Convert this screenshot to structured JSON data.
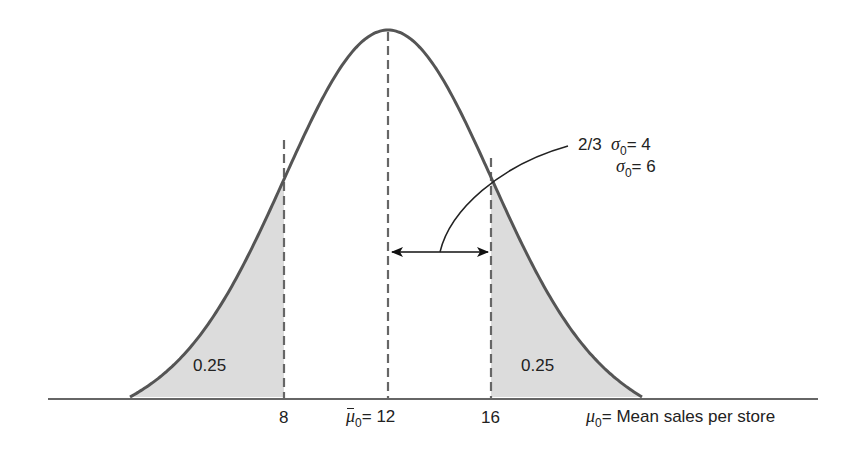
{
  "diagram": {
    "type": "normal-distribution",
    "colors": {
      "curve": "#555555",
      "shade": "#dcdcdc",
      "dashed": "#666666",
      "axis": "#333333",
      "text": "#222222"
    },
    "tails": {
      "left_area": "0.25",
      "right_area": "0.25"
    },
    "ticks": {
      "left": "8",
      "center_symbol": "μ",
      "center_sub": "0",
      "center_eq": "= 12",
      "right": "16"
    },
    "axis_label": {
      "symbol": "μ",
      "sub": "0",
      "text": "= Mean sales per store"
    },
    "annotation": {
      "line1_prefix": "2/3",
      "line1_symbol": "σ",
      "line1_sub": "0",
      "line1_eq": "= 4",
      "line2_symbol": "σ",
      "line2_sub": "0",
      "line2_eq": "= 6"
    }
  }
}
